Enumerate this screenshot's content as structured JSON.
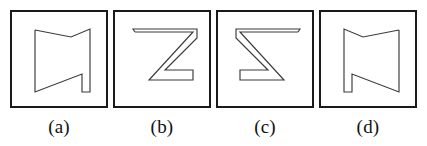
{
  "figure": {
    "type": "mental-rotation-shape-options",
    "background_color": "#ffffff",
    "border_color": "#1a1a1a",
    "stroke_color": "#3a3a3a",
    "panel_count": 4
  },
  "panels": [
    {
      "label": "(a)",
      "shape_name": "flag-notch-left-step-bottom-right",
      "points": "23,18 23,80 70,62 70,80 78,80 78,17 59,25",
      "description": "Closed polygon: vertical left edge, top notch dipping to the right, diagonal down-left edge, bottom step on the right"
    },
    {
      "label": "(b)",
      "shape_name": "z-sigma-right-facing",
      "points": "20,20 78,20 34,68 78,68 78,58 50,58 82,26 82,17 18,17"
    },
    {
      "label": "(c)",
      "shape_name": "z-sigma-left-facing-mirrored",
      "points": "80,20 22,20 66,68 22,68 22,58 50,58 18,26 18,17 82,17"
    },
    {
      "label": "(d)",
      "shape_name": "flag-notch-right-step-bottom-left-mirrored",
      "points": "78,18 78,80 31,62 31,80 23,80 23,17 42,25"
    }
  ],
  "labels": {
    "a": "(a)",
    "b": "(b)",
    "c": "(c)",
    "d": "(d)"
  }
}
